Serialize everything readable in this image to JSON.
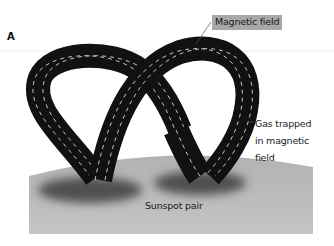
{
  "figure": {
    "panel_label": "A",
    "labels": {
      "magnetic_field": "Magnetic field",
      "gas_trapped": "Gas trapped\nin magnetic\nfield",
      "sunspot_pair": "Sunspot pair"
    },
    "icons": {
      "magnetic-loop": "two interlocking black flux-tube loops with white dashed field lines",
      "sun-surface": "gray curved solar surface",
      "sunspot": "dark blurred spots at loop footpoints"
    },
    "colors": {
      "loop": "#111111",
      "field_lines": "#d8d8d8",
      "sun_surface": "#b9b9b9",
      "sunspot": "#4a4a4a",
      "label_box": "#a8a8a8",
      "background": "#ffffff"
    }
  }
}
